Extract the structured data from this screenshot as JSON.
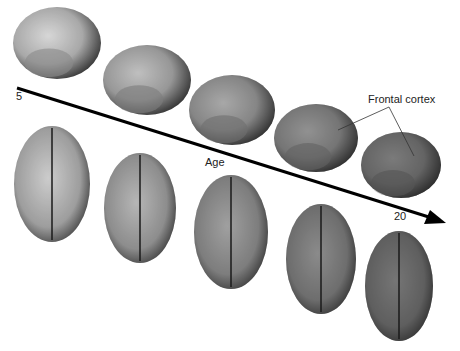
{
  "figure": {
    "axis": {
      "label": "Age",
      "start_label": "5",
      "end_label": "20"
    },
    "annotation": {
      "label": "Frontal cortex"
    },
    "lateral_views": [
      {
        "stage": 1,
        "maturity": 0.1
      },
      {
        "stage": 2,
        "maturity": 0.3
      },
      {
        "stage": 3,
        "maturity": 0.5
      },
      {
        "stage": 4,
        "maturity": 0.7
      },
      {
        "stage": 5,
        "maturity": 0.9
      }
    ],
    "top_views": [
      {
        "stage": 1,
        "maturity": 0.1
      },
      {
        "stage": 2,
        "maturity": 0.3
      },
      {
        "stage": 3,
        "maturity": 0.5
      },
      {
        "stage": 4,
        "maturity": 0.7
      },
      {
        "stage": 5,
        "maturity": 0.9
      }
    ]
  }
}
